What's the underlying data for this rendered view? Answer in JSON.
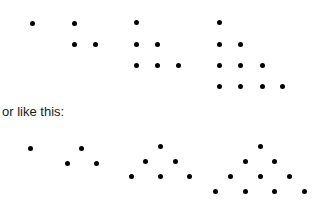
{
  "caption": "or like this:",
  "colors": {
    "dot": "#000000",
    "text": "#1a1a1a",
    "background": "#ffffff"
  },
  "staircase_figure": {
    "description": "Triangular numbers arranged as right-angle staircases",
    "groups": [
      {
        "count": 1,
        "dots": [
          [
            32,
            23
          ]
        ]
      },
      {
        "count": 3,
        "dots": [
          [
            74,
            23
          ],
          [
            74,
            44
          ],
          [
            95,
            44
          ]
        ]
      },
      {
        "count": 6,
        "dots": [
          [
            136,
            22
          ],
          [
            136,
            44
          ],
          [
            157,
            44
          ],
          [
            136,
            65
          ],
          [
            157,
            65
          ],
          [
            178,
            65
          ]
        ]
      },
      {
        "count": 10,
        "dots": [
          [
            219,
            22
          ],
          [
            219,
            44
          ],
          [
            240,
            44
          ],
          [
            219,
            65
          ],
          [
            240,
            65
          ],
          [
            262,
            65
          ],
          [
            219,
            86
          ],
          [
            240,
            86
          ],
          [
            262,
            86
          ],
          [
            282,
            86
          ]
        ]
      }
    ]
  },
  "triangle_figure": {
    "description": "Triangular numbers arranged as equilateral triangles",
    "groups": [
      {
        "count": 1,
        "dots": [
          [
            30,
            148
          ]
        ]
      },
      {
        "count": 3,
        "dots": [
          [
            81,
            148
          ],
          [
            67,
            163
          ],
          [
            96,
            163
          ]
        ]
      },
      {
        "count": 6,
        "dots": [
          [
            160,
            146
          ],
          [
            145,
            161
          ],
          [
            175,
            161
          ],
          [
            131,
            176
          ],
          [
            160,
            176
          ],
          [
            189,
            176
          ]
        ]
      },
      {
        "count": 10,
        "dots": [
          [
            260,
            146
          ],
          [
            245,
            161
          ],
          [
            274,
            161
          ],
          [
            230,
            176
          ],
          [
            260,
            176
          ],
          [
            289,
            176
          ],
          [
            215,
            191
          ],
          [
            245,
            191
          ],
          [
            274,
            191
          ],
          [
            304,
            191
          ]
        ]
      }
    ]
  }
}
